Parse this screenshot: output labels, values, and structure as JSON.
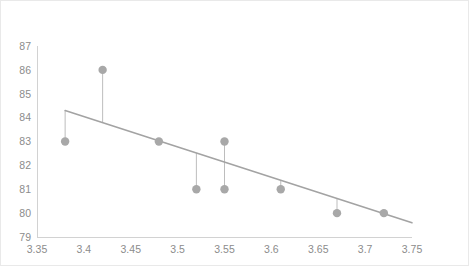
{
  "chart_data": {
    "type": "scatter",
    "title": "",
    "subtitle": "",
    "xlabel": "",
    "ylabel": "",
    "xlim": [
      3.35,
      3.75
    ],
    "ylim": [
      79,
      87
    ],
    "grid": false,
    "legend": null,
    "x_ticks": [
      "3.35",
      "3.4",
      "3.45",
      "3.5",
      "3.55",
      "3.6",
      "3.65",
      "3.7",
      "3.75"
    ],
    "x_tick_values": [
      3.35,
      3.4,
      3.45,
      3.5,
      3.55,
      3.6,
      3.65,
      3.7,
      3.75
    ],
    "y_ticks": [
      "79",
      "80",
      "81",
      "82",
      "83",
      "84",
      "85",
      "86",
      "87"
    ],
    "y_tick_values": [
      79,
      80,
      81,
      82,
      83,
      84,
      85,
      86,
      87
    ],
    "x": [
      3.38,
      3.42,
      3.48,
      3.52,
      3.55,
      3.55,
      3.61,
      3.67,
      3.72
    ],
    "y": [
      83,
      86,
      83,
      81,
      83,
      81,
      81,
      80,
      80
    ],
    "points": [
      {
        "x": 3.38,
        "y": 83
      },
      {
        "x": 3.42,
        "y": 86
      },
      {
        "x": 3.48,
        "y": 83
      },
      {
        "x": 3.52,
        "y": 81
      },
      {
        "x": 3.55,
        "y": 83
      },
      {
        "x": 3.55,
        "y": 81
      },
      {
        "x": 3.61,
        "y": 81
      },
      {
        "x": 3.67,
        "y": 80
      },
      {
        "x": 3.72,
        "y": 80
      }
    ],
    "trendline": {
      "x": [
        3.38,
        3.75
      ],
      "y": [
        84.3,
        79.6
      ]
    },
    "residuals": true,
    "marker_color": "#a8a8a8",
    "trendline_color": "#a3a3a3",
    "residual_color": "#bdbdbd",
    "axis_color": "#d2d2d2",
    "tick_label_color": "#8c8c8c",
    "border_color": "#e9e9e9",
    "background_color": "#ffffff"
  }
}
